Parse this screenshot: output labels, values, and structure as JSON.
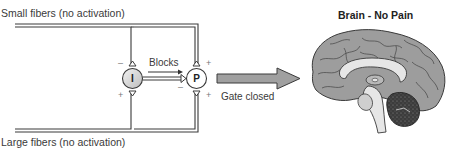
{
  "diagram": {
    "type": "gate-control-theory",
    "inputs": {
      "top": {
        "label": "Small fibers (no activation)"
      },
      "bottom": {
        "label": "Large fibers (no activation)"
      }
    },
    "nodes": {
      "inhibitory": {
        "letter": "I",
        "top_sign": "–",
        "bottom_sign": "+"
      },
      "projection": {
        "letter": "P",
        "top_sign": "+",
        "bottom_sign": "+",
        "left_sign": "–"
      }
    },
    "edges": {
      "inhibit_to_projection": {
        "label": "Blocks"
      },
      "output": {
        "label": "Gate closed"
      }
    },
    "brain": {
      "title": "Brain - No Pain"
    },
    "colors": {
      "line": "#3a3a3a",
      "node_fill": "#f4f4f4",
      "inhibitory_fill": "#d8d8d8",
      "arrow_fill": "#9a9a9a",
      "cortex": "#9d9d9d",
      "corpus": "#e6e6e6",
      "cerebellum": "#3c3c3c"
    }
  }
}
